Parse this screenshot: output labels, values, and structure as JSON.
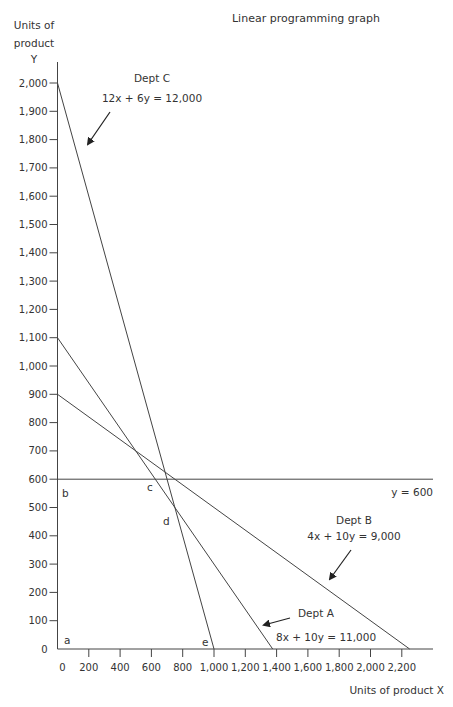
{
  "chart_data": {
    "type": "line",
    "title": "Linear programming graph",
    "xlabel": "Units of product X",
    "ylabel": [
      "Units of",
      "product",
      "Y"
    ],
    "xlim": [
      0,
      2300
    ],
    "ylim": [
      0,
      2000
    ],
    "x_ticks": [
      0,
      200,
      400,
      600,
      800,
      1000,
      1200,
      1400,
      1600,
      1800,
      2000,
      2200
    ],
    "x_tick_labels": [
      "0",
      "200",
      "400",
      "600",
      "800",
      "1,000",
      "1,200",
      "1,400",
      "1,600",
      "1,800",
      "2,000",
      "2,200"
    ],
    "y_ticks": [
      0,
      100,
      200,
      300,
      400,
      500,
      600,
      700,
      800,
      900,
      1000,
      1100,
      1200,
      1300,
      1400,
      1500,
      1600,
      1700,
      1800,
      1900,
      2000
    ],
    "y_tick_labels": [
      "0",
      "100",
      "200",
      "300",
      "400",
      "500",
      "600",
      "700",
      "800",
      "900",
      "1,000",
      "1,100",
      "1,200",
      "1,300",
      "1,400",
      "1,500",
      "1,600",
      "1,700",
      "1,800",
      "1,900",
      "2,000"
    ],
    "grid": false,
    "series": [
      {
        "name": "Dept C",
        "equation": "12x + 6y = 12,000",
        "x": [
          0,
          1000
        ],
        "y": [
          2000,
          0
        ]
      },
      {
        "name": "Dept A",
        "equation": "8x + 10y = 11,000",
        "x": [
          0,
          1375
        ],
        "y": [
          1100,
          0
        ]
      },
      {
        "name": "Dept B",
        "equation": "4x + 10y =  9,000",
        "x": [
          0,
          2250
        ],
        "y": [
          900,
          0
        ]
      },
      {
        "name": "y = 600",
        "equation": "y = 600",
        "x": [
          0,
          2300
        ],
        "y": [
          600,
          600
        ]
      }
    ],
    "points": [
      {
        "label": "a",
        "x": 0,
        "y": 0
      },
      {
        "label": "b",
        "x": 0,
        "y": 600
      },
      {
        "label": "c",
        "x": 625,
        "y": 600
      },
      {
        "label": "d",
        "x": 750,
        "y": 500
      },
      {
        "label": "e",
        "x": 1000,
        "y": 0
      }
    ],
    "annotations": [
      {
        "text": "Dept C",
        "sub": "12x + 6y = 12,000"
      },
      {
        "text": "Dept A",
        "sub": "8x + 10y = 11,000"
      },
      {
        "text": "Dept B",
        "sub": "4x + 10y =  9,000"
      },
      {
        "text": "y = 600"
      }
    ]
  }
}
